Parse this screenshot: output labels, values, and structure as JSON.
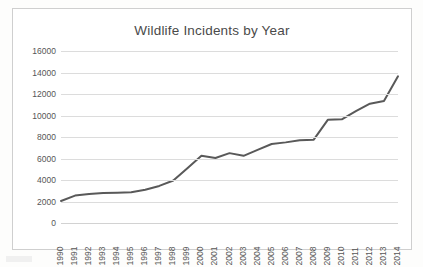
{
  "chart_data": {
    "type": "line",
    "title": "Wildlife Incidents by Year",
    "xlabel": "",
    "ylabel": "",
    "categories": [
      "1990",
      "1991",
      "1992",
      "1993",
      "1994",
      "1995",
      "1996",
      "1997",
      "1998",
      "1999",
      "2000",
      "2001",
      "2002",
      "2003",
      "2004",
      "2005",
      "2006",
      "2007",
      "2008",
      "2009",
      "2010",
      "2011",
      "2012",
      "2013",
      "2014"
    ],
    "values": [
      2050,
      2550,
      2700,
      2780,
      2820,
      2870,
      3100,
      3450,
      3950,
      5100,
      6250,
      6050,
      6500,
      6250,
      6800,
      7350,
      7500,
      7700,
      7750,
      9600,
      9650,
      10400,
      11100,
      11350,
      13650
    ],
    "series": [
      {
        "name": "Wildlife Incidents",
        "values": [
          2050,
          2550,
          2700,
          2780,
          2820,
          2870,
          3100,
          3450,
          3950,
          5100,
          6250,
          6050,
          6500,
          6250,
          6800,
          7350,
          7500,
          7700,
          7750,
          9600,
          9650,
          10400,
          11100,
          11350,
          13650
        ]
      }
    ],
    "ylim": [
      0,
      16000
    ],
    "yticks": [
      0,
      2000,
      4000,
      6000,
      8000,
      10000,
      12000,
      14000,
      16000
    ],
    "ytick_labels": [
      "0",
      "2000",
      "4000",
      "6000",
      "8000",
      "10000",
      "12000",
      "14000",
      "16000"
    ],
    "grid": true,
    "legend": false,
    "legend_position": "none",
    "line_color": "#595959",
    "grid_color": "#dcdcdc",
    "text_color": "#565656",
    "title_color": "#4a4a4a",
    "background": "#ffffff"
  }
}
